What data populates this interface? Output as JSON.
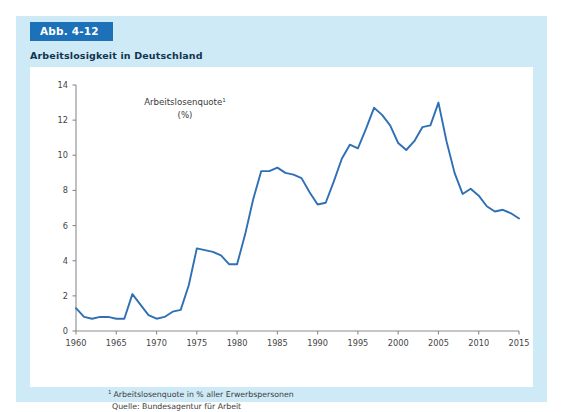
{
  "figure": {
    "badge_label": "Abb. 4-12",
    "title": "Arbeitslosigkeit in Deutschland",
    "badge_color": "#1c71b8",
    "panel_color": "#cfeaf7",
    "card_color": "#ffffff"
  },
  "footnotes": {
    "marker": "1",
    "line1": "Arbeitslosenquote in % aller Erwerbspersonen",
    "line2": "Quelle: Bundesagentur für Arbeit"
  },
  "chart_data": {
    "type": "line",
    "title": "Arbeitslosigkeit in Deutschland",
    "subtitle": "",
    "series_label_line1": "Arbeitslosenquote",
    "series_label_sup": "1",
    "series_label_line2": "(%)",
    "xlabel": "",
    "ylabel": "Arbeitslosenquote (%)",
    "xlim": [
      1960,
      2015
    ],
    "ylim": [
      0,
      14
    ],
    "ytick_step": 2,
    "xtick_step": 5,
    "yticks": [
      0,
      2,
      4,
      6,
      8,
      10,
      12,
      14
    ],
    "ytick_labels": [
      "0",
      "2",
      "4",
      "6",
      "8",
      "10",
      "12",
      "14"
    ],
    "xticks": [
      1960,
      1965,
      1970,
      1975,
      1980,
      1985,
      1990,
      1995,
      2000,
      2005,
      2010,
      2015
    ],
    "xtick_labels": [
      "1960",
      "1965",
      "1970",
      "1975",
      "1980",
      "1985",
      "1990",
      "1995",
      "2000",
      "2005",
      "2010",
      "2015"
    ],
    "grid": false,
    "legend": false,
    "line_color": "#2f6fb5",
    "series": [
      {
        "name": "Arbeitslosenquote (%)",
        "x": [
          1960,
          1961,
          1962,
          1963,
          1964,
          1965,
          1966,
          1967,
          1968,
          1969,
          1970,
          1971,
          1972,
          1973,
          1974,
          1975,
          1976,
          1977,
          1978,
          1979,
          1980,
          1981,
          1982,
          1983,
          1984,
          1985,
          1986,
          1987,
          1988,
          1989,
          1990,
          1991,
          1992,
          1993,
          1994,
          1995,
          1996,
          1997,
          1998,
          1999,
          2000,
          2001,
          2002,
          2003,
          2004,
          2005,
          2006,
          2007,
          2008,
          2009,
          2010,
          2011,
          2012,
          2013,
          2014,
          2015
        ],
        "values": [
          1.3,
          0.8,
          0.7,
          0.8,
          0.8,
          0.7,
          0.7,
          2.1,
          1.5,
          0.9,
          0.7,
          0.8,
          1.1,
          1.2,
          2.6,
          4.7,
          4.6,
          4.5,
          4.3,
          3.8,
          3.8,
          5.5,
          7.5,
          9.1,
          9.1,
          9.3,
          9.0,
          8.9,
          8.7,
          7.9,
          7.2,
          7.3,
          8.5,
          9.8,
          10.6,
          10.4,
          11.5,
          12.7,
          12.3,
          11.7,
          10.7,
          10.3,
          10.8,
          11.6,
          11.7,
          13.0,
          10.8,
          9.0,
          7.8,
          8.1,
          7.7,
          7.1,
          6.8,
          6.9,
          6.7,
          6.4
        ]
      }
    ],
    "annotations": []
  }
}
